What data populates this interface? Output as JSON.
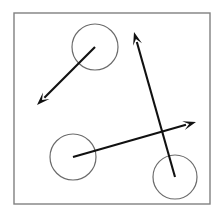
{
  "figure": {
    "title": "",
    "background_color": "#ffffff",
    "width": 222,
    "height": 220
  },
  "frame": {
    "name": "plot-border",
    "x": 14,
    "y": 13,
    "width": 196,
    "height": 191,
    "stroke_color": "#808080",
    "stroke_width": 1.4,
    "fill": "none"
  },
  "chart_data": {
    "type": "scatter",
    "title": "",
    "xlabel": "",
    "ylabel": "",
    "xlim": [
      14,
      210
    ],
    "ylim": [
      13,
      204
    ],
    "grid": false,
    "legend": null,
    "circle_stroke_color": "#6b6b6b",
    "circle_stroke_width": 1.2,
    "vector_color": "#111111",
    "vector_stroke_width": 2.1,
    "nodes": [
      {
        "id": "node-top",
        "label": "",
        "cx": 95,
        "cy": 47,
        "r": 23
      },
      {
        "id": "node-left",
        "label": "",
        "cx": 73,
        "cy": 157,
        "r": 23
      },
      {
        "id": "node-bottom-right",
        "label": "",
        "cx": 175,
        "cy": 177,
        "r": 22
      }
    ],
    "vectors": [
      {
        "id": "vector-top-southwest",
        "label": "",
        "from_node": "node-top",
        "x1": 95,
        "y1": 47,
        "x2": 37,
        "y2": 105,
        "arrowhead": "end"
      },
      {
        "id": "vector-bottomright-north",
        "label": "",
        "from_node": "node-bottom-right",
        "x1": 175,
        "y1": 177,
        "x2": 134,
        "y2": 32,
        "arrowhead": "end"
      },
      {
        "id": "vector-left-northeast",
        "label": "",
        "from_node": "node-left",
        "x1": 73,
        "y1": 157,
        "x2": 196,
        "y2": 122,
        "arrowhead": "end"
      }
    ]
  }
}
